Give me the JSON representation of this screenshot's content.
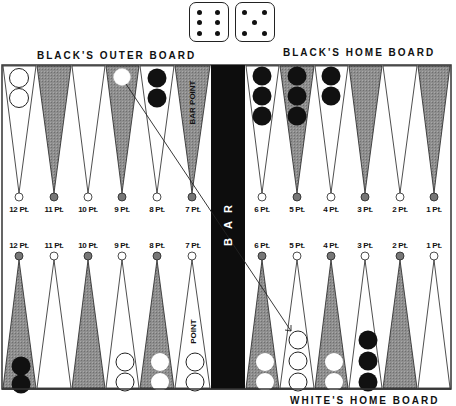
{
  "dice": [
    {
      "name": "die-six",
      "value": 6
    },
    {
      "name": "die-five",
      "value": 5
    }
  ],
  "labels": {
    "top_left": "BLACK'S OUTER BOARD",
    "top_right": "BLACK'S HOME BOARD",
    "bottom_right": "WHITE'S HOME BOARD",
    "bar": [
      "B",
      "A",
      "R"
    ],
    "bar_point_top": "BAR POINT",
    "bar_point_bottom": "POINT"
  },
  "top_points": [
    {
      "label": "12 Pt.",
      "shade": "white",
      "checkers": {
        "color": "white-outline",
        "count": 2
      }
    },
    {
      "label": "11 Pt.",
      "shade": "dark",
      "checkers": {
        "color": "none",
        "count": 0
      }
    },
    {
      "label": "10 Pt.",
      "shade": "white",
      "checkers": {
        "color": "none",
        "count": 0
      }
    },
    {
      "label": "9 Pt.",
      "shade": "dark",
      "checkers": {
        "color": "white",
        "count": 1
      }
    },
    {
      "label": "8 Pt.",
      "shade": "white",
      "checkers": {
        "color": "black",
        "count": 2
      }
    },
    {
      "label": "7 Pt.",
      "shade": "dark",
      "checkers": {
        "color": "none",
        "count": 0
      }
    },
    {
      "label": "6 Pt.",
      "shade": "white",
      "checkers": {
        "color": "black",
        "count": 3
      }
    },
    {
      "label": "5 Pt.",
      "shade": "dark",
      "checkers": {
        "color": "black",
        "count": 3
      }
    },
    {
      "label": "4 Pt.",
      "shade": "white",
      "checkers": {
        "color": "black",
        "count": 2
      }
    },
    {
      "label": "3 Pt.",
      "shade": "dark",
      "checkers": {
        "color": "none",
        "count": 0
      }
    },
    {
      "label": "2 Pt.",
      "shade": "white",
      "checkers": {
        "color": "none",
        "count": 0
      }
    },
    {
      "label": "1 Pt.",
      "shade": "dark",
      "checkers": {
        "color": "none",
        "count": 0
      }
    }
  ],
  "bottom_points": [
    {
      "label": "12 Pt.",
      "shade": "dark",
      "checkers": {
        "color": "black",
        "count": 2
      }
    },
    {
      "label": "11 Pt.",
      "shade": "white",
      "checkers": {
        "color": "none",
        "count": 0
      }
    },
    {
      "label": "10 Pt.",
      "shade": "dark",
      "checkers": {
        "color": "none",
        "count": 0
      }
    },
    {
      "label": "9 Pt.",
      "shade": "white",
      "checkers": {
        "color": "white-outline",
        "count": 2
      }
    },
    {
      "label": "8 Pt.",
      "shade": "dark",
      "checkers": {
        "color": "white",
        "count": 2
      }
    },
    {
      "label": "7 Pt.",
      "shade": "white",
      "checkers": {
        "color": "white-outline",
        "count": 2
      }
    },
    {
      "label": "6 Pt.",
      "shade": "dark",
      "checkers": {
        "color": "white",
        "count": 2
      }
    },
    {
      "label": "5 Pt.",
      "shade": "white",
      "checkers": {
        "color": "white-outline",
        "count": 3
      }
    },
    {
      "label": "4 Pt.",
      "shade": "dark",
      "checkers": {
        "color": "white",
        "count": 2
      }
    },
    {
      "label": "3 Pt.",
      "shade": "white",
      "checkers": {
        "color": "black",
        "count": 3
      }
    },
    {
      "label": "2 Pt.",
      "shade": "dark",
      "checkers": {
        "color": "none",
        "count": 0
      }
    },
    {
      "label": "1 Pt.",
      "shade": "white",
      "checkers": {
        "color": "none",
        "count": 0
      }
    }
  ],
  "move_arrow": {
    "from": "top 9 Pt.",
    "to": "bottom 5 Pt."
  },
  "colors": {
    "dark_point": "#8a8a8a",
    "bar": "#0d0d0d",
    "black_checker": "#111111",
    "white_checker": "#ffffff",
    "frame": "#333333"
  }
}
